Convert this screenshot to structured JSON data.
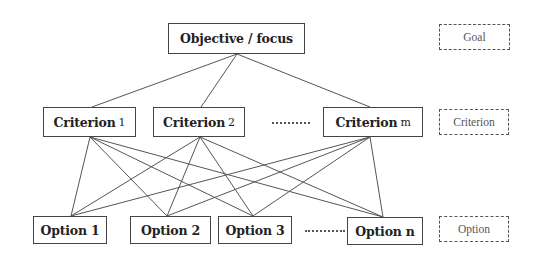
{
  "diagram": {
    "goal": {
      "label": "Objective / focus"
    },
    "criteria": [
      {
        "label": "Criterion",
        "suffix": "1"
      },
      {
        "label": "Criterion",
        "suffix": "2"
      },
      {
        "label": "Criterion",
        "suffix": "m"
      }
    ],
    "options": [
      {
        "label": "Option 1"
      },
      {
        "label": "Option 2"
      },
      {
        "label": "Option 3"
      },
      {
        "label": "Option n"
      }
    ],
    "ellipsis": "......",
    "legend": {
      "goal": "Goal",
      "criterion": "Criterion",
      "option": "Option"
    },
    "colors": {
      "line": "#555555",
      "border": "#444444",
      "text": "#222222",
      "legend_text": "#555555"
    }
  }
}
